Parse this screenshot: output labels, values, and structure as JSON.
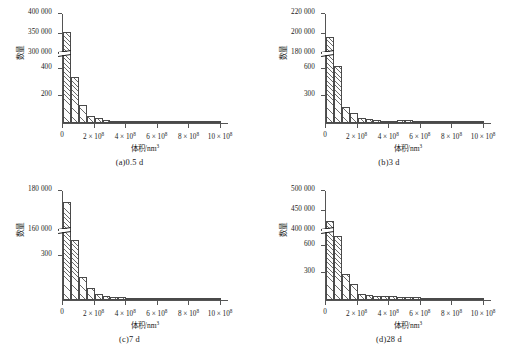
{
  "figure": {
    "axis_titles": {
      "y": "数量",
      "x_main": "体积/nm",
      "x_sup": "3"
    },
    "tick_unit_sup": "8"
  },
  "chart_data": [
    {
      "type": "bar",
      "id": "panel-a",
      "title": "(a)0.5  d",
      "caption": "(a)0.5  d",
      "xlabel": "体积/nm3",
      "ylabel": "数量",
      "axis_break": true,
      "grid": false,
      "legend": "none",
      "xlim": [
        0,
        1050000000.0
      ],
      "xticks": [
        0,
        200000000,
        400000000,
        600000000,
        800000000,
        1000000000
      ],
      "xticklabels": [
        "0",
        "2 × 10",
        "4 × 10",
        "6 × 10",
        "8 × 10",
        "10 × 10"
      ],
      "yticks_upper": [
        300000,
        350000,
        400000
      ],
      "yticklabels_upper": [
        "300 000",
        "350 000",
        "400 000"
      ],
      "yticks_lower": [
        200,
        400
      ],
      "yticklabels_lower": [
        "200",
        "400"
      ],
      "categories": [
        "0-0.5",
        "0.5-1.0",
        "1.0-1.5",
        "1.5-2.0",
        "2.0-2.5",
        "2.5-3.0",
        "3.0-3.5",
        "3.5-4.0",
        "4.0-4.5",
        "4.5-5.0",
        "5.0-5.5",
        "5.5-6.0",
        "6.0-6.5",
        "6.5-7.0",
        "7.0-7.5",
        "7.5-8.0",
        "8.0-8.5",
        "8.5-9.0",
        "9.0-9.5",
        "9.5-10.0"
      ],
      "values": [
        352000,
        330,
        128,
        52,
        34,
        24,
        17,
        13,
        11,
        8,
        7,
        18,
        6,
        3,
        2,
        9,
        2,
        1,
        1,
        1
      ],
      "values_note": "first bar reads on the upper (×1000) segment; remaining bars read on the lower segment"
    },
    {
      "type": "bar",
      "id": "panel-b",
      "title": "(b)3  d",
      "caption": "(b)3  d",
      "xlabel": "体积/nm3",
      "ylabel": "数量",
      "axis_break": true,
      "grid": false,
      "legend": "none",
      "xlim": [
        0,
        1050000000.0
      ],
      "xticks": [
        0,
        200000000,
        400000000,
        600000000,
        800000000,
        1000000000
      ],
      "xticklabels": [
        "0",
        "2 × 10",
        "4 × 10",
        "6 × 10",
        "8 × 10",
        "10 × 10"
      ],
      "yticks_upper": [
        180000,
        200000,
        220000
      ],
      "yticklabels_upper": [
        "180 000",
        "200 000",
        "220 000"
      ],
      "yticks_lower": [
        300,
        600
      ],
      "yticklabels_lower": [
        "300",
        "600"
      ],
      "categories": [
        "0-0.5",
        "0.5-1.0",
        "1.0-1.5",
        "1.5-2.0",
        "2.0-2.5",
        "2.5-3.0",
        "3.0-3.5",
        "3.5-4.0",
        "4.0-4.5",
        "4.5-5.0",
        "5.0-5.5",
        "5.5-6.0",
        "6.0-6.5",
        "6.5-7.0",
        "7.0-7.5",
        "7.5-8.0",
        "8.0-8.5",
        "8.5-9.0",
        "9.0-9.5",
        "9.5-10.0"
      ],
      "values": [
        196000,
        620,
        175,
        112,
        55,
        40,
        30,
        26,
        22,
        33,
        30,
        18,
        14,
        10,
        8,
        3,
        6,
        2,
        5,
        1
      ],
      "values_note": "first bar reads on the upper segment; remaining bars read on the lower segment"
    },
    {
      "type": "bar",
      "id": "panel-c",
      "title": "(c)7  d",
      "caption": "(c)7  d",
      "xlabel": "体积/nm3",
      "ylabel": "数量",
      "axis_break": true,
      "grid": false,
      "legend": "none",
      "xlim": [
        0,
        1050000000.0
      ],
      "xticks": [
        0,
        200000000,
        400000000,
        600000000,
        800000000,
        1000000000
      ],
      "xticklabels": [
        "0",
        "2 × 10",
        "4 × 10",
        "6 × 10",
        "8 × 10",
        "10 × 10"
      ],
      "yticks_upper": [
        160000,
        180000
      ],
      "yticklabels_upper": [
        "160 000",
        "180 000"
      ],
      "yticks_lower": [
        300
      ],
      "yticklabels_lower": [
        "300"
      ],
      "categories": [
        "0-0.5",
        "0.5-1.0",
        "1.0-1.5",
        "1.5-2.0",
        "2.0-2.5",
        "2.5-3.0",
        "3.0-3.5",
        "3.5-4.0",
        "4.0-4.5",
        "4.5-5.0",
        "5.0-5.5",
        "5.5-6.0",
        "6.0-6.5",
        "6.5-7.0",
        "7.0-7.5",
        "7.5-8.0",
        "8.0-8.5",
        "8.5-9.0",
        "9.0-9.5",
        "9.5-10.0"
      ],
      "values": [
        174000,
        395,
        155,
        80,
        42,
        28,
        22,
        20,
        12,
        6,
        4,
        8,
        5,
        3,
        6,
        4,
        3,
        2,
        2,
        1
      ],
      "values_note": "first bar reads on the upper segment; remaining bars read on the lower segment"
    },
    {
      "type": "bar",
      "id": "panel-d",
      "title": "(d)28  d",
      "caption": "(d)28  d",
      "xlabel": "体积/nm3",
      "ylabel": "数量",
      "axis_break": true,
      "grid": false,
      "legend": "none",
      "xlim": [
        0,
        1050000000.0
      ],
      "xticks": [
        0,
        200000000,
        400000000,
        600000000,
        800000000,
        1000000000
      ],
      "xticklabels": [
        "0",
        "2 × 10",
        "4 × 10",
        "6 × 10",
        "8 × 10",
        "10 × 10"
      ],
      "yticks_upper": [
        400000,
        450000,
        500000
      ],
      "yticklabels_upper": [
        "400 000",
        "450 000",
        "500 000"
      ],
      "yticks_lower": [
        300,
        600
      ],
      "yticklabels_lower": [
        "300",
        "600"
      ],
      "categories": [
        "0-0.5",
        "0.5-1.0",
        "1.0-1.5",
        "1.5-2.0",
        "2.0-2.5",
        "2.5-3.0",
        "3.0-3.5",
        "3.5-4.0",
        "4.0-4.5",
        "4.5-5.0",
        "5.0-5.5",
        "5.5-6.0",
        "6.0-6.5",
        "6.5-7.0",
        "7.0-7.5",
        "7.5-8.0",
        "8.0-8.5",
        "8.5-9.0",
        "9.0-9.5",
        "9.5-10.0"
      ],
      "values": [
        422000,
        700,
        280,
        175,
        70,
        55,
        48,
        45,
        40,
        38,
        35,
        30,
        22,
        18,
        12,
        8,
        6,
        5,
        9,
        3
      ],
      "values_note": "first bar reads on the upper segment; remaining bars read on the lower segment"
    }
  ]
}
